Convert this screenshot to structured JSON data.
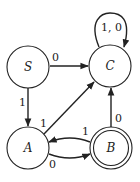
{
  "diagram": {
    "type": "finite-state-automaton",
    "states": [
      {
        "id": "S",
        "label": "S",
        "accepting": false,
        "start": true
      },
      {
        "id": "C",
        "label": "C",
        "accepting": false,
        "start": false
      },
      {
        "id": "A",
        "label": "A",
        "accepting": false,
        "start": false
      },
      {
        "id": "B",
        "label": "B",
        "accepting": true,
        "start": false
      }
    ],
    "transitions": [
      {
        "from": "S",
        "to": "C",
        "label": "0"
      },
      {
        "from": "S",
        "to": "A",
        "label": "1"
      },
      {
        "from": "A",
        "to": "C",
        "label": "1"
      },
      {
        "from": "A",
        "to": "B",
        "label": "0"
      },
      {
        "from": "B",
        "to": "A",
        "label": "1"
      },
      {
        "from": "B",
        "to": "C",
        "label": "0"
      },
      {
        "from": "C",
        "to": "C",
        "label": "1, 0"
      }
    ],
    "colors": {
      "stroke": "#222222",
      "background": "#ffffff"
    }
  }
}
